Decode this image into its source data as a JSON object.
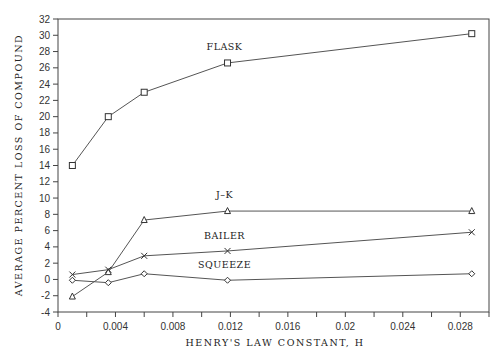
{
  "chart_data": {
    "type": "line",
    "title": "",
    "xlabel": "HENRY'S LAW CONSTANT, H",
    "ylabel": "AVERAGE PERCENT LOSS OF COMPOUND",
    "xlim": [
      0,
      0.03
    ],
    "ylim": [
      -4,
      32
    ],
    "grid": false,
    "legend": "inline labels",
    "x_ticks": [
      0,
      0.004,
      0.008,
      0.012,
      0.016,
      0.02,
      0.024,
      0.028
    ],
    "x_tick_labels": [
      "0",
      "0.004",
      "0.008",
      "0.012",
      "0.016",
      "0.02",
      "0.024",
      "0.028"
    ],
    "y_ticks": [
      -4,
      -2,
      0,
      2,
      4,
      6,
      8,
      10,
      12,
      14,
      16,
      18,
      20,
      22,
      24,
      26,
      28,
      30,
      32
    ],
    "x": [
      0.001,
      0.0035,
      0.006,
      0.0118,
      0.0288
    ],
    "series": [
      {
        "name": "FLASK",
        "marker": "square",
        "values": [
          14,
          20,
          23,
          26.6,
          30.2
        ],
        "label_at": [
          0.0118,
          28.2
        ]
      },
      {
        "name": "J-K",
        "marker": "triangle",
        "values": [
          -2.1,
          0.9,
          7.3,
          8.4,
          8.4
        ],
        "label_at": [
          0.0118,
          10.0
        ]
      },
      {
        "name": "BAILER",
        "marker": "x",
        "values": [
          0.6,
          1.2,
          2.9,
          3.5,
          5.8
        ],
        "label_at": [
          0.0118,
          5.0
        ]
      },
      {
        "name": "SQUEEZE",
        "marker": "diamond",
        "values": [
          -0.1,
          -0.4,
          0.7,
          -0.1,
          0.7
        ],
        "label_at": [
          0.0118,
          1.4
        ]
      }
    ]
  },
  "axes": {
    "xlabel": "HENRY'S LAW CONSTANT, H",
    "ylabel": "AVERAGE PERCENT LOSS OF COMPOUND"
  },
  "colors": {
    "line": "#555555",
    "axis": "#444444",
    "text": "#222222"
  }
}
